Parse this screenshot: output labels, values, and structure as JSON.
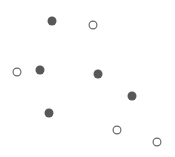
{
  "figure": {
    "width": 175,
    "height": 157,
    "background_color": "#ffffff"
  },
  "style": {
    "filled_color": "#585858",
    "open_stroke_color": "#6b6b6b",
    "open_fill_color": "#ffffff",
    "open_stroke_width": 1.2,
    "marker_diameter": 9
  },
  "chart_data": {
    "type": "scatter",
    "title": "",
    "subtitle": "",
    "xlabel": "",
    "ylabel": "",
    "xlim": [
      0,
      175
    ],
    "ylim": [
      0,
      157
    ],
    "grid": false,
    "axes_visible": false,
    "tick_labels_x": [],
    "tick_labels_y": [],
    "legend": {
      "visible": false,
      "position": "none",
      "entries": [
        {
          "name": "filled",
          "marker": "filled-circle",
          "color": "#585858"
        },
        {
          "name": "open",
          "marker": "open-circle",
          "color": "#6b6b6b"
        }
      ]
    },
    "annotations": [],
    "series": [
      {
        "name": "filled",
        "marker": "filled-circle",
        "color": "#585858",
        "size": 9,
        "points": [
          {
            "id": "p1",
            "x": 52,
            "y": 21
          },
          {
            "id": "p2",
            "x": 40,
            "y": 70
          },
          {
            "id": "p3",
            "x": 98,
            "y": 74
          },
          {
            "id": "p4",
            "x": 132,
            "y": 96
          },
          {
            "id": "p5",
            "x": 49,
            "y": 113
          }
        ]
      },
      {
        "name": "open",
        "marker": "open-circle",
        "color": "#6b6b6b",
        "size": 9,
        "points": [
          {
            "id": "o1",
            "x": 93,
            "y": 25
          },
          {
            "id": "o2",
            "x": 17,
            "y": 72
          },
          {
            "id": "o3",
            "x": 117,
            "y": 130
          },
          {
            "id": "o4",
            "x": 157,
            "y": 142
          }
        ]
      }
    ]
  }
}
